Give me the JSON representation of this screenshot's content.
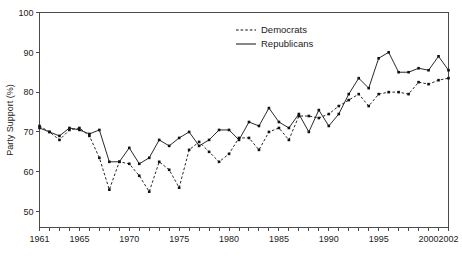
{
  "chart_data": {
    "type": "line",
    "title": "",
    "xlabel": "",
    "ylabel": "Party Support (%)",
    "xlim": [
      1961,
      2002
    ],
    "ylim": [
      46,
      100
    ],
    "grid": false,
    "legend_position": "top-center-right",
    "y_ticks": [
      50,
      60,
      70,
      80,
      90,
      100
    ],
    "y_tick_labels": [
      "50",
      "60",
      "70",
      "80",
      "90",
      "100"
    ],
    "x_tick_labels": [
      "1961",
      "1965",
      "1970",
      "1975",
      "1980",
      "1985",
      "1990",
      "1995",
      "2000",
      "2002"
    ],
    "x_tick_label_values": [
      1961,
      1965,
      1970,
      1975,
      1980,
      1985,
      1990,
      1995,
      2000,
      2002
    ],
    "x_minor_tick_interval": 1,
    "x": [
      1961,
      1962,
      1963,
      1964,
      1965,
      1966,
      1967,
      1968,
      1969,
      1970,
      1971,
      1972,
      1973,
      1974,
      1975,
      1976,
      1977,
      1978,
      1979,
      1980,
      1981,
      1982,
      1983,
      1984,
      1985,
      1986,
      1987,
      1988,
      1989,
      1990,
      1991,
      1992,
      1993,
      1994,
      1995,
      1996,
      1997,
      1998,
      1999,
      2000,
      2001,
      2002
    ],
    "series": [
      {
        "name": "Democrats",
        "style": "dashed",
        "marker": "square",
        "values": [
          71.5,
          70.0,
          68.0,
          70.5,
          71.0,
          69.0,
          63.5,
          55.5,
          62.5,
          62.0,
          59.0,
          55.0,
          62.5,
          60.5,
          56.0,
          65.5,
          67.5,
          65.0,
          62.5,
          64.5,
          68.5,
          68.5,
          65.5,
          70.0,
          71.0,
          68.0,
          74.0,
          74.0,
          73.5,
          74.5,
          76.5,
          78.0,
          79.5,
          76.5,
          79.5,
          80.0,
          80.0,
          79.5,
          82.5,
          82.0,
          83.0,
          83.5
        ]
      },
      {
        "name": "Republicans",
        "style": "solid",
        "marker": "square",
        "values": [
          71.0,
          70.0,
          69.0,
          71.0,
          70.5,
          69.5,
          70.5,
          62.5,
          62.5,
          66.0,
          62.0,
          63.5,
          68.0,
          66.5,
          68.5,
          70.0,
          66.5,
          68.0,
          70.5,
          70.5,
          68.0,
          72.5,
          71.5,
          76.0,
          72.5,
          71.0,
          74.5,
          70.0,
          75.5,
          71.5,
          74.5,
          79.5,
          83.5,
          81.0,
          88.5,
          90.0,
          85.0,
          85.0,
          86.0,
          85.5,
          89.0,
          85.5
        ]
      }
    ]
  },
  "legend": {
    "entries": [
      {
        "label": "Democrats"
      },
      {
        "label": "Republicans"
      }
    ]
  }
}
